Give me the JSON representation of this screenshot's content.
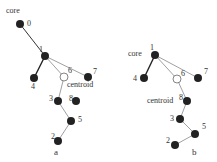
{
  "diagrams": [
    {
      "caption": "a",
      "core_label": "core",
      "centroid_label": "centroid",
      "nodes": [
        {
          "id": "0",
          "x": 20,
          "y": 24,
          "hollow": false
        },
        {
          "id": "1",
          "x": 45,
          "y": 56,
          "hollow": false
        },
        {
          "id": "4",
          "x": 34,
          "y": 78,
          "hollow": false
        },
        {
          "id": "6",
          "x": 64,
          "y": 77,
          "hollow": true
        },
        {
          "id": "7",
          "x": 88,
          "y": 77,
          "hollow": false
        },
        {
          "id": "3",
          "x": 58,
          "y": 101,
          "hollow": false
        },
        {
          "id": "8",
          "x": 76,
          "y": 101,
          "hollow": false
        },
        {
          "id": "5",
          "x": 71,
          "y": 121,
          "hollow": false
        },
        {
          "id": "2",
          "x": 58,
          "y": 141,
          "hollow": false
        }
      ],
      "edges": [
        [
          "1",
          "0"
        ],
        [
          "1",
          "4"
        ],
        [
          "1",
          "6"
        ],
        [
          "1",
          "7"
        ],
        [
          "6",
          "3"
        ],
        [
          "3",
          "5"
        ],
        [
          "5",
          "2"
        ]
      ]
    },
    {
      "caption": "b",
      "core_label": "core",
      "centroid_label": "centroid",
      "nodes": [
        {
          "id": "1",
          "x": 155,
          "y": 55,
          "hollow": false
        },
        {
          "id": "4",
          "x": 144,
          "y": 78,
          "hollow": false
        },
        {
          "id": "6",
          "x": 177,
          "y": 79,
          "hollow": true
        },
        {
          "id": "7",
          "x": 198,
          "y": 78,
          "hollow": false
        },
        {
          "id": "8",
          "x": 187,
          "y": 101,
          "hollow": false
        },
        {
          "id": "3",
          "x": 180,
          "y": 119,
          "hollow": false
        },
        {
          "id": "5",
          "x": 195,
          "y": 134,
          "hollow": false
        },
        {
          "id": "2",
          "x": 175,
          "y": 145,
          "hollow": false
        }
      ],
      "edges": [
        [
          "1",
          "4"
        ],
        [
          "1",
          "6"
        ],
        [
          "1",
          "7"
        ],
        [
          "6",
          "8"
        ],
        [
          "8",
          "3"
        ],
        [
          "3",
          "5"
        ],
        [
          "5",
          "2"
        ]
      ]
    }
  ]
}
